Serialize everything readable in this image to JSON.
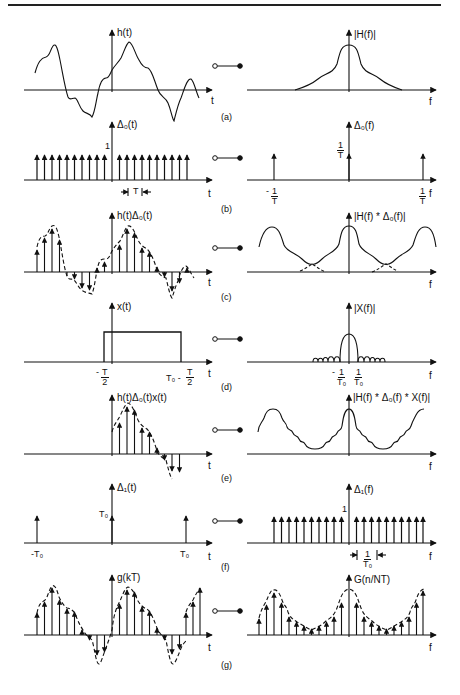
{
  "figure": {
    "transform_pair_symbol": "o—●",
    "rows": [
      {
        "tag": "(a)",
        "time": {
          "label": "h(t)",
          "axis": "t",
          "kind": "continuous waveform"
        },
        "freq": {
          "label": "|H(f)|",
          "axis": "f",
          "kind": "band-limited spectrum"
        }
      },
      {
        "tag": "(b)",
        "time": {
          "label": "Δ₀(t)",
          "axis": "t",
          "kind": "impulse train",
          "impulse_height_label": "1",
          "spacing_label": "T"
        },
        "freq": {
          "label": "Δ₀(f)",
          "axis": "f",
          "kind": "impulse train",
          "height_label": {
            "num": "1",
            "den": "T"
          },
          "left_tick": {
            "num": "1",
            "den": "T",
            "sign": "-"
          },
          "right_tick": {
            "num": "1",
            "den": "T"
          }
        }
      },
      {
        "tag": "(c)",
        "time": {
          "label": "h(t)Δ₀(t)",
          "axis": "t",
          "kind": "sampled waveform"
        },
        "freq": {
          "label": "|H(f) * Δ₀(f)|",
          "axis": "f",
          "kind": "periodic spectrum with aliasing"
        }
      },
      {
        "tag": "(d)",
        "time": {
          "label": "x(t)",
          "axis": "t",
          "kind": "rectangular window",
          "left_tick": {
            "num": "T",
            "den": "2",
            "sign": "-"
          },
          "right_tick_prefix": "T₀ -",
          "right_tick": {
            "num": "T",
            "den": "2"
          }
        },
        "freq": {
          "label": "|X(f)|",
          "axis": "f",
          "kind": "sinc magnitude",
          "left_tick": {
            "num": "1",
            "den": "T₀",
            "sign": "-"
          },
          "right_tick": {
            "num": "1",
            "den": "T₀"
          }
        }
      },
      {
        "tag": "(e)",
        "time": {
          "label": "h(t)Δ₀(t)x(t)",
          "axis": "t",
          "kind": "windowed samples"
        },
        "freq": {
          "label": "|H(f) * Δ₀(f) * X(f)|",
          "axis": "f",
          "kind": "rippled periodic spectrum"
        }
      },
      {
        "tag": "(f)",
        "time": {
          "label": "Δ₁(t)",
          "axis": "t",
          "kind": "impulse train",
          "height_label": "T₀",
          "left_tick": "-T₀",
          "right_tick": "T₀"
        },
        "freq": {
          "label": "Δ₁(f)",
          "axis": "f",
          "kind": "impulse train",
          "impulse_height_label": "1",
          "spacing_label": {
            "num": "1",
            "den": "T₀"
          }
        }
      },
      {
        "tag": "(g)",
        "time": {
          "label": "g(kT)",
          "axis": "t",
          "kind": "periodic sampled waveform"
        },
        "freq": {
          "label": "G(n/NT)",
          "axis": "f",
          "kind": "periodic sampled spectrum"
        }
      }
    ]
  }
}
